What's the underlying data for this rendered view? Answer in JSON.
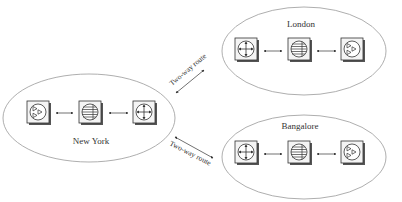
{
  "diagram": {
    "type": "network topology",
    "sites": [
      {
        "name": "New York",
        "devices": [
          "triangles-icon",
          "lines-icon",
          "crosshair-icon"
        ]
      },
      {
        "name": "London",
        "devices": [
          "crosshair-icon",
          "lines-icon",
          "triangles-icon"
        ]
      },
      {
        "name": "Bangalore",
        "devices": [
          "crosshair-icon",
          "lines-icon",
          "triangles-icon"
        ]
      }
    ],
    "routes": [
      {
        "from": "New York",
        "to": "London",
        "label": "Two-way route"
      },
      {
        "from": "New York",
        "to": "Bangalore",
        "label": "Two-way route"
      }
    ],
    "colors": {
      "stroke": "#333333",
      "ellipse": "#999999",
      "icon_fill": "#f2f2f2",
      "shadow": "#555555"
    }
  }
}
